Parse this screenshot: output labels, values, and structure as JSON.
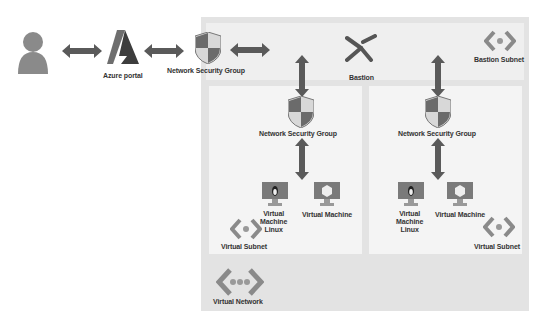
{
  "diagram": {
    "type": "azure-architecture",
    "nodes": {
      "user": {
        "label": ""
      },
      "azure_portal": {
        "label": "Azure portal"
      },
      "nsg_top": {
        "label": "Network Security Group"
      },
      "bastion": {
        "label": "Bastion"
      },
      "bastion_subnet": {
        "label": "Bastion Subnet"
      },
      "nsg_left": {
        "label": "Network Security Group"
      },
      "nsg_right": {
        "label": "Network Security Group"
      },
      "vm_linux_left": {
        "label_line1": "Virtual",
        "label_line2": "Machine",
        "label_line3": "Linux"
      },
      "vm_left": {
        "label": "Virtual Machine"
      },
      "vm_linux_right": {
        "label_line1": "Virtual",
        "label_line2": "Machine",
        "label_line3": "Linux"
      },
      "vm_right": {
        "label": "Virtual Machine"
      },
      "subnet_left": {
        "label": "Virtual Subnet"
      },
      "subnet_right": {
        "label": "Virtual Subnet"
      },
      "vnet": {
        "label": "Virtual Network"
      }
    },
    "edges": [
      {
        "from": "user",
        "to": "azure_portal",
        "direction": "both"
      },
      {
        "from": "azure_portal",
        "to": "nsg_top",
        "direction": "both"
      },
      {
        "from": "nsg_top",
        "to": "bastion",
        "direction": "both"
      },
      {
        "from": "bastion_subnet",
        "to": "nsg_left",
        "direction": "both"
      },
      {
        "from": "bastion_subnet",
        "to": "nsg_right",
        "direction": "both"
      },
      {
        "from": "nsg_left",
        "to": "vm_linux_left",
        "direction": "both"
      },
      {
        "from": "nsg_right",
        "to": "vm_linux_right",
        "direction": "both"
      }
    ],
    "colors": {
      "arrow": "#5a5a5a",
      "vnet_bg": "#e3e3e3",
      "subnet_bg": "#f4f4f4",
      "shield_dark": "#6b6b6b",
      "shield_light": "#d8d8d8"
    }
  }
}
